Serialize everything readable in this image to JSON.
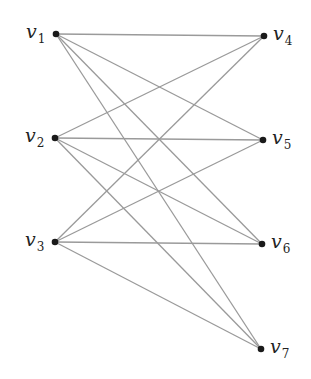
{
  "diagram": {
    "type": "bipartite-graph",
    "nodes": [
      {
        "id": "v1",
        "base": "v",
        "sub": "1",
        "x": 56,
        "y": 34,
        "side": "left"
      },
      {
        "id": "v2",
        "base": "v",
        "sub": "2",
        "x": 55,
        "y": 138,
        "side": "left"
      },
      {
        "id": "v3",
        "base": "v",
        "sub": "3",
        "x": 55,
        "y": 242,
        "side": "left"
      },
      {
        "id": "v4",
        "base": "v",
        "sub": "4",
        "x": 264,
        "y": 36,
        "side": "right"
      },
      {
        "id": "v5",
        "base": "v",
        "sub": "5",
        "x": 263,
        "y": 140,
        "side": "right"
      },
      {
        "id": "v6",
        "base": "v",
        "sub": "6",
        "x": 262,
        "y": 244,
        "side": "right"
      },
      {
        "id": "v7",
        "base": "v",
        "sub": "7",
        "x": 261,
        "y": 349,
        "side": "right"
      }
    ],
    "edges": [
      [
        "v1",
        "v4"
      ],
      [
        "v1",
        "v5"
      ],
      [
        "v1",
        "v6"
      ],
      [
        "v1",
        "v7"
      ],
      [
        "v2",
        "v4"
      ],
      [
        "v2",
        "v5"
      ],
      [
        "v2",
        "v6"
      ],
      [
        "v2",
        "v7"
      ],
      [
        "v3",
        "v4"
      ],
      [
        "v3",
        "v5"
      ],
      [
        "v3",
        "v6"
      ],
      [
        "v3",
        "v7"
      ]
    ],
    "colors": {
      "edge": "#9a9a9a",
      "node": "#1a1a1a",
      "label": "#222222"
    }
  }
}
